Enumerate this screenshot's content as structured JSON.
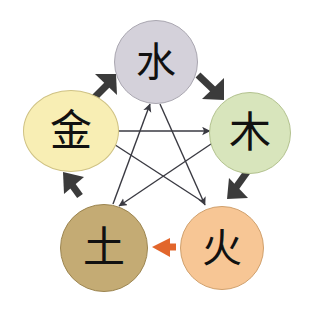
{
  "diagram": {
    "background_color": "#ffffff",
    "nodes": [
      {
        "id": "water",
        "label": "水",
        "meaning": "water",
        "position": "top",
        "fill_color": "#d4d1da",
        "stroke_color": "#a9a6b0",
        "text_color": "#111111",
        "cx": 156,
        "cy": 62,
        "r": 42
      },
      {
        "id": "metal",
        "label": "金",
        "meaning": "metal",
        "position": "left",
        "fill_color": "#f8eeb4",
        "stroke_color": "#cfc284",
        "text_color": "#111111",
        "cx": 71,
        "cy": 131,
        "r": 45
      },
      {
        "id": "wood",
        "label": "木",
        "meaning": "wood",
        "position": "right",
        "fill_color": "#d8e5bc",
        "stroke_color": "#b3c28f",
        "text_color": "#111111",
        "cx": 250,
        "cy": 133,
        "r": 41
      },
      {
        "id": "earth",
        "label": "土",
        "meaning": "earth",
        "position": "bottom-left",
        "fill_color": "#c4ab74",
        "stroke_color": "#9c8550",
        "text_color": "#111111",
        "cx": 104,
        "cy": 248,
        "r": 44
      },
      {
        "id": "fire",
        "label": "火",
        "meaning": "fire",
        "position": "bottom-right",
        "fill_color": "#f7c695",
        "stroke_color": "#d0a06c",
        "text_color": "#111111",
        "cx": 222,
        "cy": 248,
        "r": 42
      }
    ],
    "generating_arrows": [
      {
        "id": "metal-to-water",
        "from": "metal",
        "to": "water",
        "color": "#3b3b3b",
        "style": "thick-outer",
        "direction": "up-right"
      },
      {
        "id": "water-to-wood",
        "from": "water",
        "to": "wood",
        "color": "#3b3b3b",
        "style": "thick-outer",
        "direction": "down-right"
      },
      {
        "id": "wood-to-fire",
        "from": "wood",
        "to": "fire",
        "color": "#3b3b3b",
        "style": "thick-outer",
        "direction": "down-left"
      },
      {
        "id": "fire-to-earth",
        "from": "fire",
        "to": "earth",
        "color": "#e2662c",
        "style": "thick-outer",
        "direction": "left"
      },
      {
        "id": "earth-to-metal",
        "from": "earth",
        "to": "metal",
        "color": "#3b3b3b",
        "style": "thick-outer",
        "direction": "up-left"
      }
    ],
    "overcoming_arrows": [
      {
        "id": "metal-to-wood",
        "from": "metal",
        "to": "wood",
        "color": "#3a3a42",
        "style": "thin-inner"
      },
      {
        "id": "wood-to-earth",
        "from": "wood",
        "to": "earth",
        "color": "#3a3a42",
        "style": "thin-inner"
      },
      {
        "id": "earth-to-water",
        "from": "earth",
        "to": "water",
        "color": "#3a3a42",
        "style": "thin-inner"
      },
      {
        "id": "water-to-fire",
        "from": "water",
        "to": "fire",
        "color": "#3a3a42",
        "style": "thin-inner"
      },
      {
        "id": "fire-to-metal",
        "from": "fire",
        "to": "metal",
        "color": "#3a3a42",
        "style": "thin-inner"
      }
    ]
  }
}
